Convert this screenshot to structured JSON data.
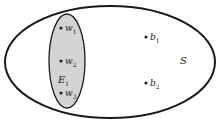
{
  "diagram": {
    "type": "venn",
    "universe": {
      "label": "S"
    },
    "event": {
      "label": "E",
      "subscript": "1",
      "fill": "#d4d4d4"
    },
    "inside_points": [
      {
        "name": "w",
        "sub": "1"
      },
      {
        "name": "w",
        "sub": "2"
      },
      {
        "name": "w",
        "sub": "3"
      }
    ],
    "outside_points": [
      {
        "name": "b",
        "sub": "1"
      },
      {
        "name": "b",
        "sub": "2"
      }
    ]
  }
}
